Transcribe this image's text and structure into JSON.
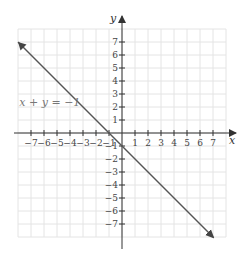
{
  "chart_data": {
    "type": "line",
    "title": "",
    "xlabel": "x",
    "ylabel": "y",
    "xlim": [
      -8,
      8
    ],
    "ylim": [
      -8,
      8
    ],
    "grid": true,
    "x_ticks": [
      -7,
      -6,
      -5,
      -4,
      -3,
      -2,
      -1,
      1,
      2,
      3,
      4,
      5,
      6,
      7
    ],
    "y_ticks": [
      -7,
      -6,
      -5,
      -4,
      -3,
      -2,
      -1,
      1,
      2,
      3,
      4,
      5,
      6,
      7
    ],
    "x_tick_labels": [
      "−7",
      "−6",
      "−5",
      "−4",
      "−3",
      "−2",
      "−1",
      "1",
      "2",
      "3",
      "4",
      "5",
      "6",
      "7"
    ],
    "y_tick_labels": [
      "−7",
      "−6",
      "−5",
      "−4",
      "−3",
      "−2",
      "−1",
      "1",
      "2",
      "3",
      "4",
      "5",
      "6",
      "7"
    ],
    "series": [
      {
        "name": "x + y = −1",
        "equation": "x + y = −1",
        "x": [
          -8,
          7
        ],
        "y": [
          7,
          -8
        ],
        "arrows": "both",
        "color": "#555555"
      }
    ],
    "annotations": [
      {
        "text": "x + y = −1",
        "x": -7.9,
        "y": 2.1
      }
    ]
  },
  "labels": {
    "x_axis": "x",
    "y_axis": "y",
    "equation": "x + y = −1"
  }
}
